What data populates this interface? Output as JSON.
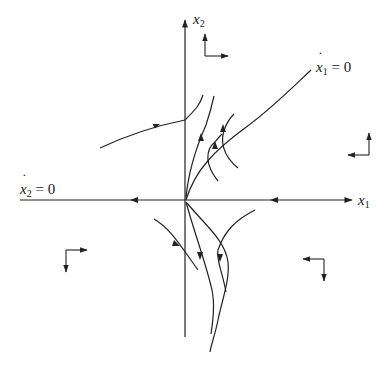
{
  "figure": {
    "stroke_color": "#222222",
    "background": "#ffffff"
  },
  "axes": {
    "x_axis": {
      "label_var": "x",
      "label_sub": "1"
    },
    "y_axis": {
      "label_var": "x",
      "label_sub": "2"
    }
  },
  "nullclines": [
    {
      "id": "x1dot",
      "var": "x",
      "sub": "1",
      "eq": " = 0",
      "description": "curve from origin rising to upper right"
    },
    {
      "id": "x2dot",
      "var": "x",
      "sub": "2",
      "eq": " = 0",
      "description": "coincides with horizontal x1 axis"
    }
  ],
  "direction_indicators": [
    {
      "region": "upper-left-of-top",
      "vertical": "up",
      "horizontal": "right"
    },
    {
      "region": "right",
      "vertical": "up",
      "horizontal": "left"
    },
    {
      "region": "lower-left",
      "vertical": "down",
      "horizontal": "right"
    },
    {
      "region": "lower-right",
      "vertical": "down",
      "horizontal": "left"
    }
  ],
  "trajectories_count": 9
}
